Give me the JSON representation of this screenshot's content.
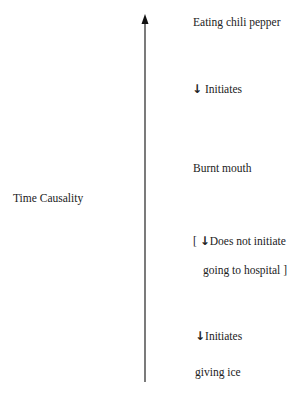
{
  "axis": {
    "label": "Time Causality",
    "direction": "up"
  },
  "events": [
    {
      "label": "Eating chili pepper"
    },
    {
      "label": "Burnt mouth"
    },
    {
      "label": "giving ice"
    }
  ],
  "relations": [
    {
      "arrow": "↓",
      "label": "Initiates"
    },
    {
      "bracket_open": "[",
      "arrow": "↓",
      "label": "Does not initiate",
      "continuation": "going to hospital ]"
    },
    {
      "arrow": "↓",
      "label": "Initiates"
    }
  ],
  "colors": {
    "line": "#222222",
    "text": "#222222",
    "background": "#ffffff"
  }
}
